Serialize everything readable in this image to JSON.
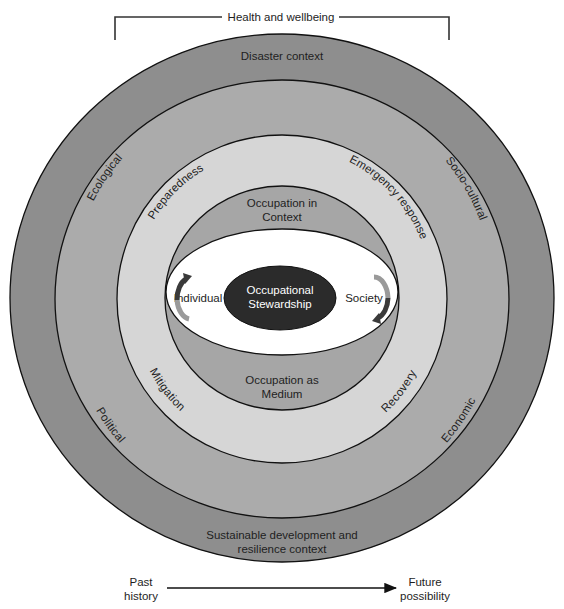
{
  "header": {
    "bracket_label": "Health and wellbeing"
  },
  "rings": {
    "outer": {
      "top_label": "Disaster context",
      "bottom_label_line1": "Sustainable development and",
      "bottom_label_line2": "resilience context",
      "color": "#8e8e8e"
    },
    "contexts": {
      "top_left": "Ecological",
      "top_right": "Socio-cultural",
      "bottom_left": "Political",
      "bottom_right": "Economic",
      "color": "#ababab"
    },
    "phases": {
      "top_left": "Preparedness",
      "top_right": "Emergency response",
      "bottom_left": "Mitigation",
      "bottom_right": "Recovery",
      "color": "#d6d6d6"
    },
    "occupation": {
      "top_line1": "Occupation in",
      "top_line2": "Context",
      "bottom_line1": "Occupation as",
      "bottom_line2": "Medium",
      "color": "#a6a6a6"
    }
  },
  "center": {
    "left_label": "Individual",
    "right_label": "Society",
    "core_line1": "Occupational",
    "core_line2": "Stewardship",
    "core_color": "#2b2b2b",
    "ellipse_color": "#ffffff"
  },
  "timeline": {
    "start_line1": "Past",
    "start_line2": "history",
    "end_line1": "Future",
    "end_line2": "possibility"
  }
}
